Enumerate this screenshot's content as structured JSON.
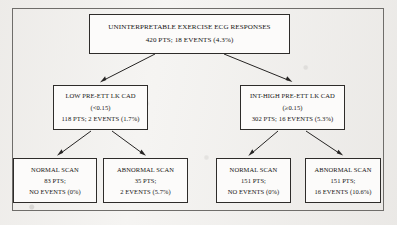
{
  "figure": {
    "type": "flowchart",
    "title_visible": false,
    "levels": 3,
    "outer_frame": true
  },
  "nodes": {
    "root": {
      "name": "uninterpretable-exercise-ecg-responses",
      "lines": [
        "UNINTERPRETABLE EXERCISE ECG RESPONSES",
        "420 PTS; 18 EVENTS (4.3%)"
      ],
      "patients": 420,
      "events": 18,
      "event_rate": "4.3%"
    },
    "low": {
      "name": "low-pre-ett-lk-cad",
      "lines": [
        "LOW PRE-ETT LK CAD",
        "(<0.15)",
        "118 PTS; 2 EVENTS (1.7%)"
      ],
      "threshold": "(<0.15)",
      "patients": 118,
      "events": 2,
      "event_rate": "1.7%"
    },
    "high": {
      "name": "int-high-pre-ett-lk-cad",
      "lines": [
        "INT-HIGH PRE-ETT LK CAD",
        "(≥0.15)",
        "302 PTS; 16 EVENTS (5.3%)"
      ],
      "threshold": "(≥0.15)",
      "patients": 302,
      "events": 16,
      "event_rate": "5.3%"
    },
    "low_normal": {
      "name": "low-normal-scan",
      "lines": [
        "NORMAL SCAN",
        "83 PTS;",
        "NO EVENTS (0%)"
      ],
      "patients": 83,
      "events": 0,
      "event_rate": "0%"
    },
    "low_abnormal": {
      "name": "low-abnormal-scan",
      "lines": [
        "ABNORMAL SCAN",
        "35 PTS;",
        "2 EVENTS (5.7%)"
      ],
      "patients": 35,
      "events": 2,
      "event_rate": "5.7%"
    },
    "high_normal": {
      "name": "int-high-normal-scan",
      "lines": [
        "NORMAL SCAN",
        "151 PTS;",
        "NO EVENTS (0%)"
      ],
      "patients": 151,
      "events": 0,
      "event_rate": "0%"
    },
    "high_abnormal": {
      "name": "int-high-abnormal-scan",
      "lines": [
        "ABNORMAL SCAN",
        "151 PTS;",
        "16 EVENTS (10.6%)"
      ],
      "patients": 151,
      "events": 16,
      "event_rate": "10.6%"
    }
  },
  "edges": [
    {
      "from": "root",
      "to": "low"
    },
    {
      "from": "root",
      "to": "high"
    },
    {
      "from": "low",
      "to": "low_normal"
    },
    {
      "from": "low",
      "to": "low_abnormal"
    },
    {
      "from": "high",
      "to": "high_normal"
    },
    {
      "from": "high",
      "to": "high_abnormal"
    }
  ],
  "colors": {
    "paper": "#f3f2f0",
    "box_fill": "#fcfbfa",
    "box_border": "#2e2c2a",
    "frame_border": "#6f6d6a",
    "text": "#161514",
    "arrow": "#262423"
  }
}
